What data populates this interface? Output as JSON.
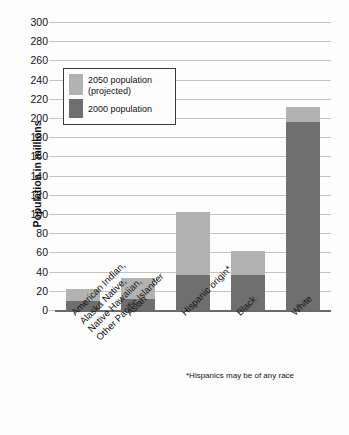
{
  "chart_data": {
    "type": "bar",
    "subtype": "stacked",
    "title": "",
    "xlabel": "",
    "ylabel": "Population in millions",
    "ylim": [
      0,
      300
    ],
    "ytick_step": 20,
    "yticks": [
      0,
      20,
      40,
      60,
      80,
      100,
      120,
      140,
      160,
      180,
      200,
      220,
      240,
      260,
      280,
      300
    ],
    "grid": true,
    "legend_position": "upper-left-inside",
    "categories": [
      "American Indian, Alaska Native, Native Hawaiian, Other Pacific Islander",
      "Asian",
      "Hispanic origin*",
      "Black",
      "White"
    ],
    "category_label_lines": [
      [
        "American Indian,",
        "Alaska Native,",
        "Native Hawaiian,",
        "Other Pacific Islander"
      ],
      [
        "Asian"
      ],
      [
        "Hispanic origin*"
      ],
      [
        "Black"
      ],
      [
        "White"
      ]
    ],
    "series": [
      {
        "name": "2000 population",
        "color": "#6f6f6f",
        "values": [
          9,
          11,
          36,
          36,
          196
        ]
      },
      {
        "name": "2050 population (projected)",
        "color": "#b2b2b2",
        "values": [
          22,
          33,
          102,
          61,
          211
        ],
        "note": "values are bar totals; light segment is the increment above the 2000 value"
      }
    ],
    "annotations": [
      "*Hispanics may be of any race"
    ]
  },
  "axis": {
    "y_title": "Population in millions",
    "tick_labels": [
      "300",
      "280",
      "260",
      "240",
      "220",
      "200",
      "180",
      "160",
      "140",
      "120",
      "100",
      "80",
      "60",
      "40",
      "20",
      "0"
    ]
  },
  "legend": {
    "items": [
      {
        "label_line1": "2050 population",
        "label_line2": "(projected)",
        "color": "#b2b2b2"
      },
      {
        "label_line1": "2000 population",
        "label_line2": "",
        "color": "#6f6f6f"
      }
    ]
  },
  "footnote": {
    "text": "*Hispanics may be of any race"
  }
}
